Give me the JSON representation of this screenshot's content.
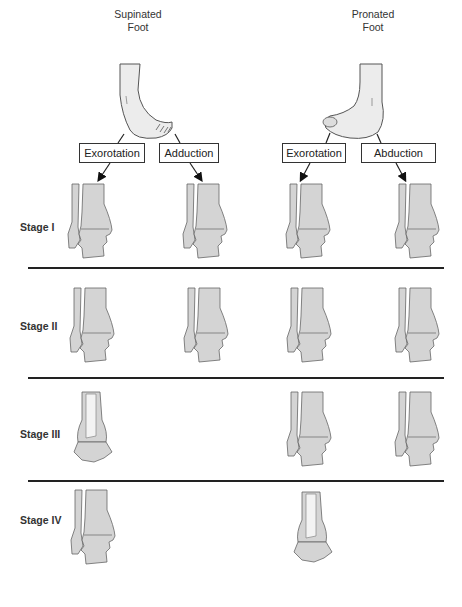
{
  "feet": [
    {
      "label_line1": "Supinated",
      "label_line2": "Foot"
    },
    {
      "label_line1": "Pronated",
      "label_line2": "Foot"
    }
  ],
  "mechanisms": [
    {
      "label": "Exorotation",
      "foot": "Supinated"
    },
    {
      "label": "Adduction",
      "foot": "Supinated"
    },
    {
      "label": "Exorotation",
      "foot": "Pronated"
    },
    {
      "label": "Abduction",
      "foot": "Pronated"
    }
  ],
  "stages": [
    {
      "label": "Stage I",
      "illustrations": [
        "SE-I",
        "SA-I",
        "PE-I",
        "PA-I"
      ]
    },
    {
      "label": "Stage II",
      "illustrations": [
        "SE-II",
        "SA-II",
        "PE-II",
        "PA-II"
      ]
    },
    {
      "label": "Stage III",
      "illustrations": [
        "SE-III",
        "",
        "PE-III",
        "PA-III"
      ]
    },
    {
      "label": "Stage IV",
      "illustrations": [
        "SE-IV",
        "",
        "PE-IV",
        ""
      ]
    }
  ],
  "colors": {
    "bone_fill": "#d4d4d4",
    "outline": "#555555",
    "line": "#222222",
    "background": "#ffffff"
  }
}
